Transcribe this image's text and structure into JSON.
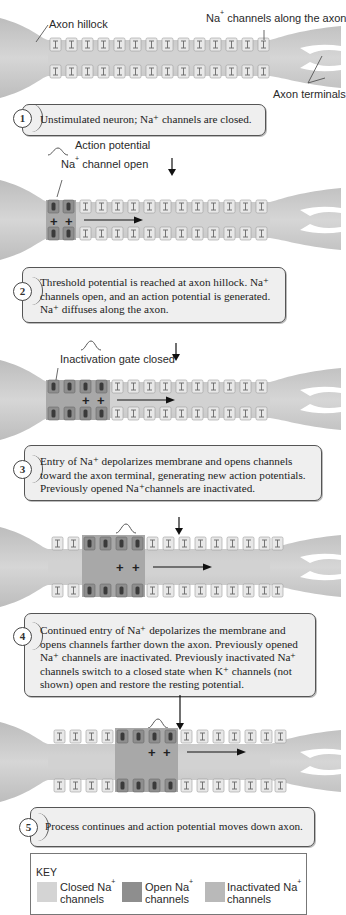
{
  "diagram": {
    "labels": {
      "axon_hillock": "Axon hillock",
      "na_channels_along_axon": "Na",
      "na_channels_along_axon_sup": "+",
      "na_channels_along_axon_rest": " channels along the axon",
      "axon_terminals": "Axon terminals",
      "action_potential": "Action potential",
      "na_channel_open_a": "Na",
      "na_channel_open_sup": "+",
      "na_channel_open_b": " channel open",
      "inactivation_gate_closed": "Inactivation gate closed"
    },
    "steps": [
      {
        "number": "1",
        "lines": [
          "Unstimulated neuron; Na⁺ channels are closed."
        ]
      },
      {
        "number": "2",
        "lines": [
          "Threshold potential is reached at axon hillock. Na⁺",
          "channels open, and an action potential is generated.",
          "Na⁺ diffuses along the axon."
        ]
      },
      {
        "number": "3",
        "lines": [
          "Entry of Na⁺ depolarizes membrane and opens channels",
          "toward the axon terminal, generating new action potentials.",
          "Previously opened Na⁺channels are inactivated."
        ]
      },
      {
        "number": "4",
        "lines": [
          "Continued entry of Na⁺ depolarizes the membrane and",
          "opens channels farther down the axon. Previously opened",
          "Na⁺ channels are inactivated. Previously inactivated Na⁺",
          "channels switch to a closed state when K⁺ channels (not",
          "shown) open and restore the resting potential."
        ]
      },
      {
        "number": "5",
        "lines": [
          "Process continues and action potential moves down axon."
        ]
      }
    ],
    "plus_sign": "+",
    "key": {
      "title": "KEY",
      "items": [
        {
          "label_a": "Closed Na",
          "sup": "+",
          "label_b": "channels",
          "color": "#d4d4d4"
        },
        {
          "label_a": "Open Na",
          "sup": "+",
          "label_b": "channels",
          "color": "#8e8e8e"
        },
        {
          "label_a": "Inactivated Na",
          "sup": "+",
          "label_b": "channels",
          "color": "#b9b9b9"
        }
      ]
    },
    "colors": {
      "axon_body": "#c9c9c9",
      "closed_channel": "#e6e6e6",
      "open_channel": "#8e8e8e",
      "inactivated_region": "#a9a9a9",
      "step_box": "#efefef"
    }
  }
}
